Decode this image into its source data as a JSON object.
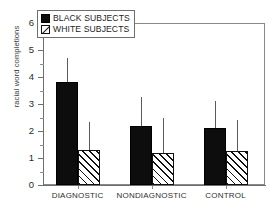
{
  "chart_data": {
    "type": "bar",
    "title": "",
    "xlabel": "",
    "ylabel": "racial word completions",
    "ylim": [
      0,
      6
    ],
    "ytick_labels": [
      "0",
      "1",
      "2",
      "3",
      "4",
      "5",
      "6"
    ],
    "ytick_values": [
      0,
      1,
      2,
      3,
      4,
      5,
      6
    ],
    "grid": false,
    "legend_position": "top-left",
    "categories": [
      "DIAGNOSTIC",
      "NONDIAGNOSTIC",
      "CONTROL"
    ],
    "series": [
      {
        "name": "BLACK SUBJECTS",
        "fill": "solid-black",
        "color": "#0d0d0d",
        "values": [
          3.8,
          2.2,
          2.1
        ],
        "error_upper": [
          4.7,
          3.25,
          3.1
        ]
      },
      {
        "name": "WHITE SUBJECTS",
        "fill": "diagonal-hatch",
        "color": "#ffffff",
        "values": [
          1.3,
          1.2,
          1.25
        ],
        "error_upper": [
          2.35,
          2.5,
          2.4
        ]
      }
    ],
    "error_bar_style": "upper-only-no-caps"
  },
  "legend": {
    "items": [
      {
        "label": "BLACK SUBJECTS",
        "swatch": "filled-square-icon"
      },
      {
        "label": "WHITE SUBJECTS",
        "swatch": "hatched-square-icon"
      }
    ]
  },
  "axes": {
    "y_title": "racial word completions",
    "y_labels": [
      "6",
      "5",
      "4",
      "3",
      "2",
      "1",
      "0"
    ],
    "x_labels": [
      "DIAGNOSTIC",
      "NONDIAGNOSTIC",
      "CONTROL"
    ]
  },
  "artifact": {
    "top_fragment": ""
  }
}
